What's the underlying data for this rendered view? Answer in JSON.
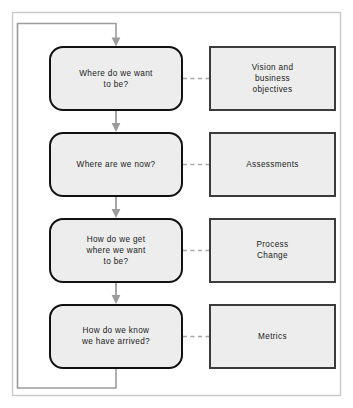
{
  "diagram": {
    "canvas": {
      "width": 353,
      "height": 408,
      "background": "#ffffff"
    },
    "colors": {
      "node_fill": "#ededed",
      "round_node_stroke": "#111111",
      "rect_node_stroke": "#3b3b3b",
      "flow_line": "#9c9c9c",
      "dashed_connector": "#a8a8a8",
      "outer_frame": "#c9c9c9",
      "text": "#1a1a1a"
    },
    "question_nodes": [
      {
        "id": "q1",
        "shape": "rounded-rectangle",
        "lines": [
          "Where do we want",
          "to be?"
        ]
      },
      {
        "id": "q2",
        "shape": "rounded-rectangle",
        "lines": [
          "Where are we now?"
        ]
      },
      {
        "id": "q3",
        "shape": "rounded-rectangle",
        "lines": [
          "How do we get",
          "where we want",
          "to be?"
        ]
      },
      {
        "id": "q4",
        "shape": "rounded-rectangle",
        "lines": [
          "How do we know",
          "we have arrived?"
        ]
      }
    ],
    "answer_nodes": [
      {
        "id": "a1",
        "shape": "rectangle",
        "lines": [
          "Vision and",
          "business",
          "objectives"
        ]
      },
      {
        "id": "a2",
        "shape": "rectangle",
        "lines": [
          "Assessments"
        ]
      },
      {
        "id": "a3",
        "shape": "rectangle",
        "lines": [
          "Process",
          "Change"
        ]
      },
      {
        "id": "a4",
        "shape": "rectangle",
        "lines": [
          "Metrics"
        ]
      }
    ],
    "connectors": {
      "vertical_flow_count": 3,
      "dashed_link_count": 4,
      "feedback_loop": "from bottom of last question node, around the left side, back to top of first question node"
    }
  }
}
